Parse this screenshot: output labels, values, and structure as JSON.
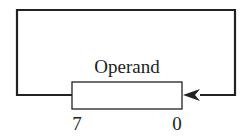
{
  "diagram": {
    "register": {
      "label": "Operand",
      "bit_high": "7",
      "bit_low": "0"
    },
    "feedback_loop": {
      "description": "rotate: bit 7 output loops back to bit 0 input",
      "arrow_direction": "left-into-bit-0"
    },
    "colors": {
      "line": "#222222",
      "box_fill": "#ffffff",
      "background": "#ffffff"
    }
  }
}
